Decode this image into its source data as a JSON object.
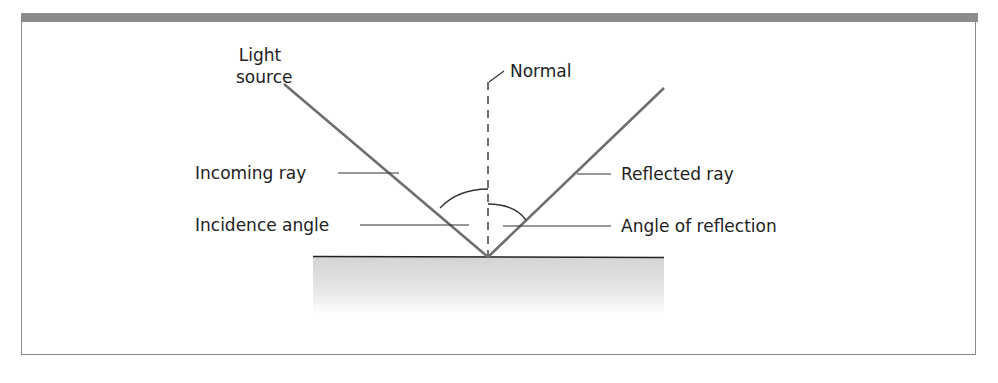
{
  "figure": {
    "labels": {
      "light_source_line1": "Light",
      "light_source_line2": "source",
      "normal": "Normal",
      "incoming_ray": "Incoming ray",
      "incidence_angle": "Incidence angle",
      "reflected_ray": "Reflected ray",
      "angle_of_reflection": "Angle of reflection"
    },
    "colors": {
      "header_bar": "#8c8c8c",
      "frame": "#8a8a8a",
      "ray": "#6e6e6e",
      "leader_line": "#333333",
      "surface_line": "#222222",
      "surface_shade_top": "#d6d6d6",
      "surface_shade_bottom": "#ffffff"
    },
    "geometry": {
      "reflection_point": [
        488,
        257
      ],
      "incoming_ray_start": [
        284,
        84
      ],
      "reflected_ray_end": [
        664,
        88
      ],
      "normal_top": [
        488,
        82
      ],
      "surface_span": [
        313,
        664
      ]
    }
  }
}
